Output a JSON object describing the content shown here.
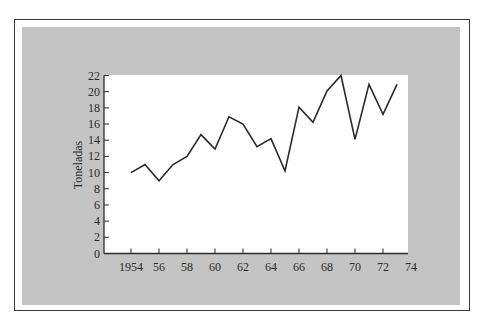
{
  "chart_data": {
    "type": "line",
    "title": "",
    "xlabel": "",
    "ylabel": "Toneladas",
    "x": [
      1954,
      1955,
      1956,
      1957,
      1958,
      1959,
      1960,
      1961,
      1962,
      1963,
      1964,
      1965,
      1966,
      1967,
      1968,
      1969,
      1970,
      1971,
      1972,
      1973
    ],
    "values": [
      10,
      11,
      9,
      11,
      12,
      14.7,
      12.9,
      16.9,
      16,
      13.2,
      14.2,
      10.2,
      18.1,
      16.2,
      20.1,
      22,
      14.1,
      20.9,
      17.2,
      20.9
    ],
    "x_tick_labels": [
      "1954",
      "56",
      "58",
      "60",
      "62",
      "64",
      "66",
      "68",
      "70",
      "72",
      "74"
    ],
    "x_ticks": [
      1954,
      1956,
      1958,
      1960,
      1962,
      1964,
      1966,
      1968,
      1970,
      1972,
      1974
    ],
    "y_tick_labels": [
      "0",
      "2",
      "4",
      "6",
      "8",
      "10",
      "12",
      "14",
      "16",
      "18",
      "20",
      "22"
    ],
    "y_ticks": [
      0,
      2,
      4,
      6,
      8,
      10,
      12,
      14,
      16,
      18,
      20,
      22
    ],
    "xlim": [
      1952,
      1974
    ],
    "ylim": [
      0,
      22
    ],
    "grid": false,
    "legend": null,
    "line_color": "#2a2a2a"
  },
  "colors": {
    "panel_background": "#c4c4c4",
    "plot_background": "#ffffff",
    "frame_border": "#3a3a3a",
    "ink": "#2a2a2a"
  }
}
